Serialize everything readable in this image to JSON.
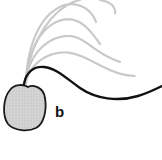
{
  "figure": {
    "panel_label": "b",
    "colors": {
      "background": "#ffffff",
      "flagellum": "#111111",
      "ghost_trace": "#c8c8c8",
      "cell_fill": "#cfcfcf",
      "cell_outline": "#1a1a1a"
    },
    "elements": {
      "cell_body": "cell-body",
      "flagellum_current": "flagellum",
      "flagellum_previous_traces": 5
    }
  }
}
